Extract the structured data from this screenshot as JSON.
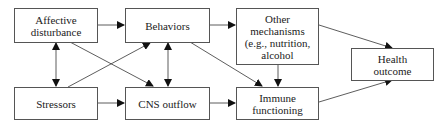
{
  "diagram": {
    "nodes": {
      "affective": {
        "label": "Affective disturbance"
      },
      "behaviors": {
        "label": "Behaviors"
      },
      "other": {
        "label": "Other mechanisms (e.g., nutrition, alcohol"
      },
      "health": {
        "label": "Health outcome"
      },
      "stressors": {
        "label": "Stressors"
      },
      "cns": {
        "label": "CNS outflow"
      },
      "immune": {
        "label": "Immune functioning"
      }
    },
    "edges": [
      {
        "from": "Affective disturbance",
        "to": "Behaviors"
      },
      {
        "from": "Behaviors",
        "to": "Other mechanisms"
      },
      {
        "from": "Other mechanisms",
        "to": "Health outcome"
      },
      {
        "from": "Other mechanisms",
        "to": "Immune functioning"
      },
      {
        "from": "Affective disturbance",
        "to": "Stressors",
        "bidirectional": true
      },
      {
        "from": "Behaviors",
        "to": "CNS outflow",
        "bidirectional": true
      },
      {
        "from": "Affective disturbance",
        "to": "CNS outflow"
      },
      {
        "from": "Stressors",
        "to": "Behaviors"
      },
      {
        "from": "Behaviors",
        "to": "Immune functioning"
      },
      {
        "from": "Stressors",
        "to": "CNS outflow"
      },
      {
        "from": "CNS outflow",
        "to": "Immune functioning"
      },
      {
        "from": "Immune functioning",
        "to": "Health outcome"
      }
    ]
  }
}
